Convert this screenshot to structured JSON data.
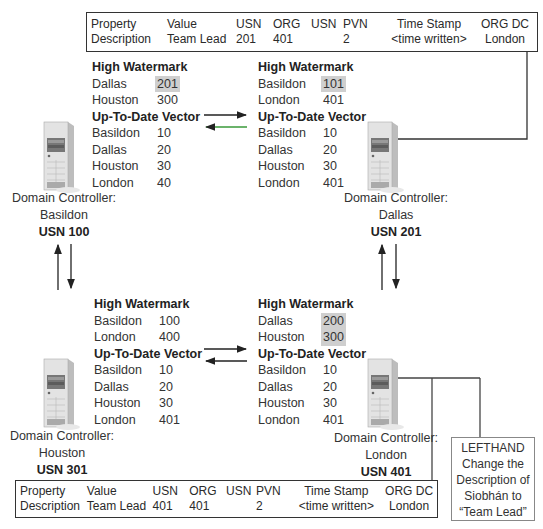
{
  "top_record": {
    "headers": [
      "Property",
      "Value",
      "USN",
      "ORG",
      "USN",
      "PVN",
      "Time Stamp",
      "ORG DC"
    ],
    "values": [
      "Description",
      "Team Lead",
      "201",
      "401",
      "",
      "2",
      "<time written>",
      "London"
    ]
  },
  "bottom_record": {
    "headers": [
      "Property",
      "Value",
      "USN",
      "ORG",
      "USN",
      "PVN",
      "Time Stamp",
      "ORG DC"
    ],
    "values": [
      "Description",
      "Team Lead",
      "401",
      "401",
      "",
      "2",
      "<time written>",
      "London"
    ]
  },
  "labels": {
    "high_watermark": "High Watermark",
    "utd_vector": "Up-To-Date Vector",
    "dc_prefix": "Domain Controller:"
  },
  "controllers": {
    "basildon": {
      "name": "Basildon",
      "usn": "USN 100",
      "high_watermark": [
        {
          "dc": "Dallas",
          "val": "201",
          "highlight": true
        },
        {
          "dc": "Houston",
          "val": "300",
          "highlight": false
        }
      ],
      "utd": [
        {
          "dc": "Basildon",
          "val": "10"
        },
        {
          "dc": "Dallas",
          "val": "20"
        },
        {
          "dc": "Houston",
          "val": "30"
        },
        {
          "dc": "London",
          "val": "40"
        }
      ]
    },
    "dallas": {
      "name": "Dallas",
      "usn": "USN 201",
      "high_watermark": [
        {
          "dc": "Basildon",
          "val": "101",
          "highlight": true
        },
        {
          "dc": "London",
          "val": "401",
          "highlight": false
        }
      ],
      "utd": [
        {
          "dc": "Basildon",
          "val": "10"
        },
        {
          "dc": "Dallas",
          "val": "20"
        },
        {
          "dc": "Houston",
          "val": "30"
        },
        {
          "dc": "London",
          "val": "401"
        }
      ]
    },
    "houston": {
      "name": "Houston",
      "usn": "USN 301",
      "high_watermark": [
        {
          "dc": "Basildon",
          "val": "100",
          "highlight": false
        },
        {
          "dc": "London",
          "val": "400",
          "highlight": false
        }
      ],
      "utd": [
        {
          "dc": "Basildon",
          "val": "10"
        },
        {
          "dc": "Dallas",
          "val": "20"
        },
        {
          "dc": "Houston",
          "val": "30"
        },
        {
          "dc": "London",
          "val": "401"
        }
      ]
    },
    "london": {
      "name": "London",
      "usn": "USN 401",
      "high_watermark": [
        {
          "dc": "Dallas",
          "val": "200",
          "highlight": true
        },
        {
          "dc": "Houston",
          "val": "300",
          "highlight": true
        }
      ],
      "utd": [
        {
          "dc": "Basildon",
          "val": "10"
        },
        {
          "dc": "Dallas",
          "val": "20"
        },
        {
          "dc": "Houston",
          "val": "30"
        },
        {
          "dc": "London",
          "val": "401"
        }
      ]
    }
  },
  "note": {
    "lines": [
      "LEFTHAND",
      "Change the",
      "Description of",
      "Siobhán to",
      "“Team Lead”"
    ]
  },
  "colors": {
    "highlight": "#cfcfcf",
    "arrow_dark": "#222222",
    "arrow_green": "#3a9a3a"
  }
}
